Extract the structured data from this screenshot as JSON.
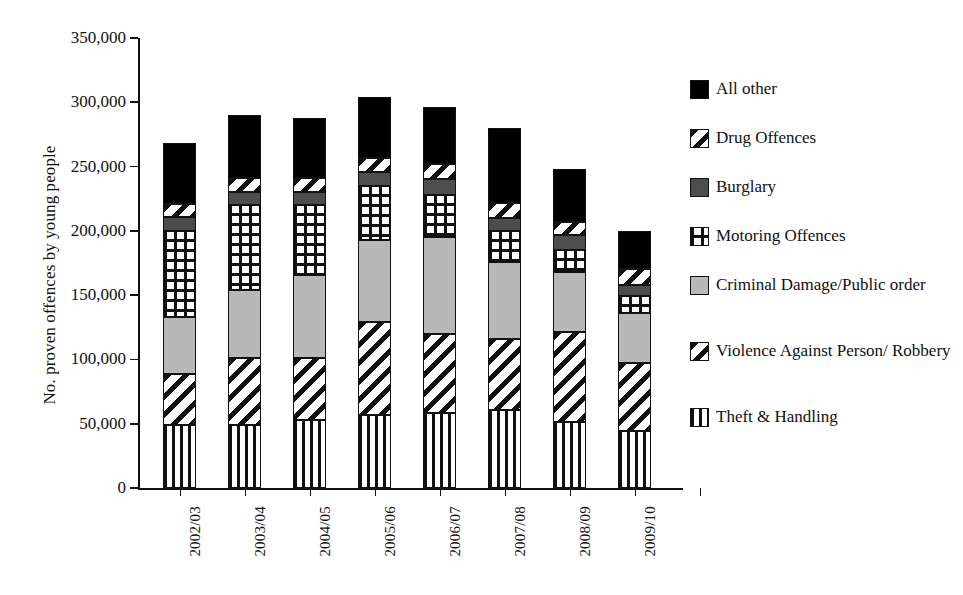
{
  "chart_data": {
    "type": "bar",
    "subtype": "stacked-bar",
    "title": "",
    "xlabel": "",
    "ylabel": "No. proven offences by young people",
    "ylim": [
      0,
      350000
    ],
    "ytick_values": [
      0,
      50000,
      100000,
      150000,
      200000,
      250000,
      300000,
      350000
    ],
    "ytick_labels": [
      "0",
      "50,000",
      "100,000",
      "150,000",
      "200,000",
      "250,000",
      "300,000",
      "350,000"
    ],
    "grid": false,
    "legend_position": "right",
    "categories": [
      "2002/03",
      "2003/04",
      "2004/05",
      "2005/06",
      "2006/07",
      "2007/08",
      "2008/09",
      "2009/10"
    ],
    "stack_order_bottom_to_top": [
      "Theft & Handling",
      "Violence Against Person/ Robbery",
      "Criminal Damage/Public order",
      "Motoring Offences",
      "Burglary",
      "Drug Offences",
      "All other"
    ],
    "series": [
      {
        "name": "Theft & Handling",
        "pattern": "vertical-stripes",
        "values": [
          49000,
          49000,
          53000,
          57000,
          58000,
          61000,
          51000,
          44000
        ]
      },
      {
        "name": "Violence Against Person/ Robbery",
        "pattern": "diagonal-stripes",
        "values": [
          40000,
          52000,
          48000,
          72000,
          62000,
          55000,
          70000,
          53000
        ]
      },
      {
        "name": "Criminal Damage/Public order",
        "pattern": "light-gray",
        "values": [
          44000,
          53000,
          65000,
          64000,
          75000,
          60000,
          47000,
          39000
        ]
      },
      {
        "name": "Motoring Offences",
        "pattern": "dot-grid",
        "values": [
          67000,
          66000,
          54000,
          42000,
          33000,
          24000,
          17000,
          13000
        ]
      },
      {
        "name": "Burglary",
        "pattern": "dark-gray",
        "values": [
          11000,
          10000,
          10000,
          11000,
          12000,
          10000,
          12000,
          9000
        ]
      },
      {
        "name": "Drug Offences",
        "pattern": "diagonal-stripes",
        "values": [
          10000,
          11000,
          11000,
          11000,
          12000,
          12000,
          10000,
          12000
        ]
      },
      {
        "name": "All other",
        "pattern": "solid-black",
        "values": [
          47000,
          49000,
          47000,
          47000,
          44000,
          58000,
          41000,
          30000
        ]
      }
    ],
    "totals": [
      268000,
      290000,
      288000,
      304000,
      296000,
      280000,
      248000,
      200000
    ]
  },
  "legend": {
    "items": [
      {
        "label": "All other",
        "swatch": "solid-black"
      },
      {
        "label": "Drug Offences",
        "swatch": "diagonal-stripes"
      },
      {
        "label": "Burglary",
        "swatch": "dark-gray"
      },
      {
        "label": "Motoring Offences",
        "swatch": "dot-grid"
      },
      {
        "label": "Criminal Damage/Public order",
        "swatch": "light-gray"
      },
      {
        "label": "Violence Against Person/ Robbery",
        "swatch": "diagonal-stripes"
      },
      {
        "label": "Theft & Handling",
        "swatch": "vertical-stripes"
      }
    ]
  },
  "colors": {
    "axis": "#111111",
    "all_other": "#000000",
    "burglary": "#4d4d4d",
    "criminal_damage": "#b8b8b8",
    "background": "#ffffff"
  }
}
